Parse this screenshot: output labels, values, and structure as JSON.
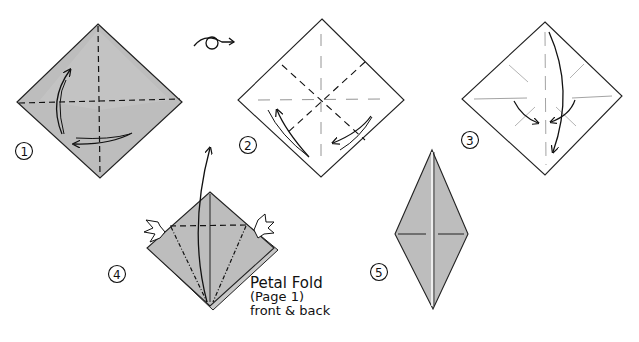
{
  "diagram": {
    "title_visible": false,
    "colors": {
      "paper_gray": "#bdbdbd",
      "paper_gray_light": "#cfcfcf",
      "paper_white": "#ffffff",
      "ink": "#111111",
      "crease_light": "#9a9a9a"
    },
    "steps": [
      {
        "number": "1",
        "label": "Step 1",
        "description": "Colored square, valley fold both diagonals; arrows show folding"
      },
      {
        "number": "2",
        "label": "Step 2",
        "description": "Turned over, white side; fold edges to center along creases"
      },
      {
        "number": "3",
        "label": "Step 3",
        "description": "Collapse into preliminary base; arrows fold corners inward and down"
      },
      {
        "number": "4",
        "label": "Step 4",
        "description": "Preliminary base; kite folds and petal fold up"
      },
      {
        "number": "5",
        "label": "Step 5",
        "description": "Completed bird base (diamond shape)"
      }
    ],
    "turn_over_icon": "turn-over-icon",
    "note": {
      "line1": "Petal Fold",
      "line2": "(Page 1)",
      "line3": "front & back"
    }
  }
}
